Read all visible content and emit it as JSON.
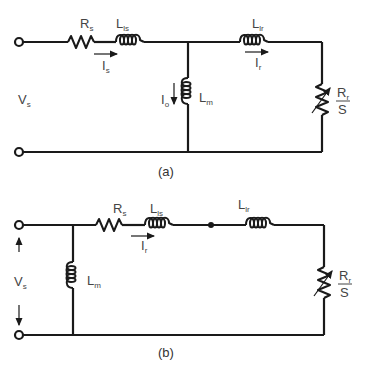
{
  "diagram": {
    "colors": {
      "line": "#1a1a1a",
      "text": "#444444"
    },
    "circuit_a": {
      "caption": "(a)",
      "labels": {
        "rs_main": "R",
        "rs_sub": "s",
        "lls_main": "L",
        "lls_sub": "ls",
        "llr_main": "L",
        "llr_sub": "lr",
        "lm_main": "L",
        "lm_sub": "m",
        "is_main": "I",
        "is_sub": "s",
        "ir_main": "I",
        "ir_sub": "r",
        "io_main": "I",
        "io_sub": "o",
        "vs_main": "V",
        "vs_sub": "s",
        "rr_main": "R",
        "rr_sub": "r",
        "slip": "S"
      }
    },
    "circuit_b": {
      "caption": "(b)",
      "labels": {
        "rs_main": "R",
        "rs_sub": "s",
        "lls_main": "L",
        "lls_sub": "ls",
        "llr_main": "L",
        "llr_sub": "lr",
        "lm_main": "L",
        "lm_sub": "m",
        "ir_main": "I",
        "ir_sub": "r",
        "vs_main": "V",
        "vs_sub": "s",
        "rr_main": "R",
        "rr_sub": "r",
        "slip": "S"
      }
    }
  }
}
